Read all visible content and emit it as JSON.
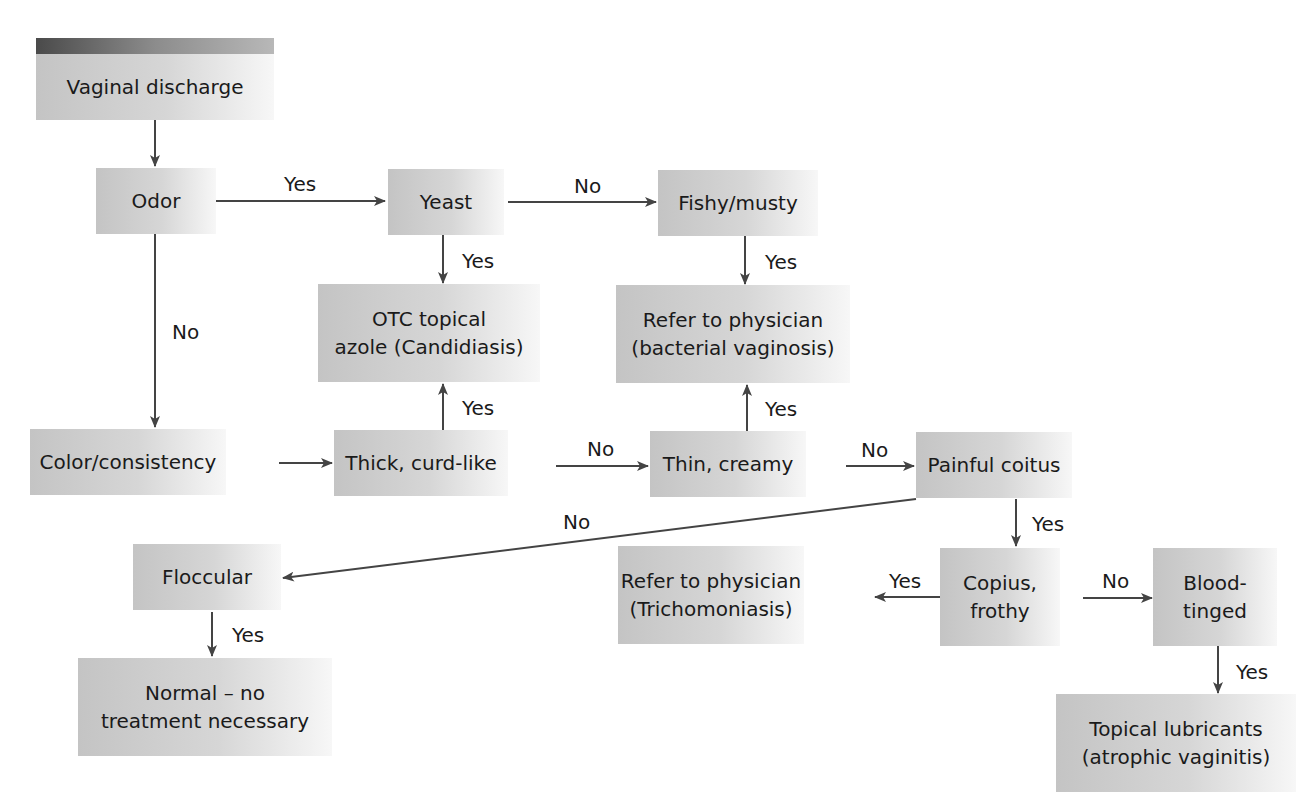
{
  "diagram": {
    "type": "flowchart",
    "title": "Vaginal discharge",
    "colors": {
      "box_dark": "#c4c4c4",
      "box_light": "#f7f7f7",
      "header_bar": "#4a4a4a",
      "line": "#444444"
    },
    "nodes": {
      "start": "Vaginal discharge",
      "odor": "Odor",
      "yeast": "Yeast",
      "fishy": "Fishy/musty",
      "otc": "OTC topical\nazole (Candidiasis)",
      "refer_bv": "Refer to physician\n(bacterial vaginosis)",
      "color": "Color/consistency",
      "thick": "Thick, curd-like",
      "thin": "Thin, creamy",
      "painful": "Painful coitus",
      "floccular": "Floccular",
      "normal": "Normal – no\ntreatment necessary",
      "refer_tri": "Refer to physician\n(Trichomoniasis)",
      "copius": "Copius,\nfrothy",
      "blood": "Blood-\ntinged",
      "lubricants": "Topical lubricants\n(atrophic vaginitis)"
    },
    "edge_labels": {
      "odor_yeast": "Yes",
      "yeast_fishy": "No",
      "yeast_otc": "Yes",
      "fishy_refer": "Yes",
      "odor_color": "No",
      "thick_otc": "Yes",
      "thin_refer": "Yes",
      "thick_thin": "No",
      "thin_painful": "No",
      "painful_floccular": "No",
      "painful_copius": "Yes",
      "floccular_normal": "Yes",
      "copius_refer": "Yes",
      "copius_blood": "No",
      "blood_lubricants": "Yes"
    }
  }
}
